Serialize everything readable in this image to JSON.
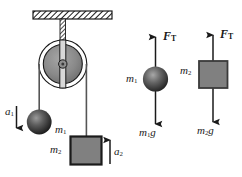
{
  "figure": {
    "background_color": "#ffffff",
    "ink_color": "#1a1a1a"
  },
  "system_diagram": {
    "ceiling": {
      "name": "hatched-ceiling-support"
    },
    "pulley": {
      "name": "pulley-wheel",
      "rim_color": "#f2f2f2",
      "disk_color": "#8c8c8c"
    },
    "mass1": {
      "label": "m",
      "subscript": "1",
      "shape": "sphere",
      "color": "#4d4d4d"
    },
    "mass2": {
      "label": "m",
      "subscript": "2",
      "shape": "block",
      "color": "#808080"
    },
    "accel1": {
      "label": "a",
      "subscript": "1",
      "direction": "down"
    },
    "accel2": {
      "label": "a",
      "subscript": "2",
      "direction": "up"
    }
  },
  "free_body_1": {
    "object_label": "m",
    "object_subscript": "1",
    "shape": "sphere",
    "tension": {
      "label": "F",
      "subscript": "T",
      "direction": "up"
    },
    "weight": {
      "label": "m",
      "subscript": "1",
      "suffix": "g",
      "direction": "down"
    }
  },
  "free_body_2": {
    "object_label": "m",
    "object_subscript": "2",
    "shape": "block",
    "tension": {
      "label": "F",
      "subscript": "T",
      "direction": "up"
    },
    "weight": {
      "label": "m",
      "subscript": "2",
      "suffix": "g",
      "direction": "down"
    }
  }
}
